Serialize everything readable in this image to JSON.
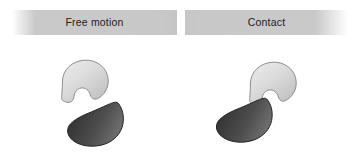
{
  "figure": {
    "width": 359,
    "height": 160,
    "background": "#ffffff"
  },
  "panels": [
    {
      "id": "free-motion",
      "label": "Free motion",
      "bar_color": "#c8c8c8",
      "label_color": "#1c1c1c",
      "state": "separated",
      "shapes": [
        {
          "name": "light-bean-shape",
          "role": "upper-body",
          "fill_light": "#e8e8e8",
          "fill_dark": "#c2c2c2",
          "outline": "#8d8d8d"
        },
        {
          "name": "dark-blob-shape",
          "role": "lower-body",
          "fill_light": "#747474",
          "fill_dark": "#343434",
          "outline": "#222222"
        }
      ]
    },
    {
      "id": "contact",
      "label": "Contact",
      "bar_color": "#c8c8c8",
      "label_color": "#1c1c1c",
      "state": "touching",
      "shapes": [
        {
          "name": "light-bean-shape",
          "role": "upper-body",
          "fill_light": "#e8e8e8",
          "fill_dark": "#c2c2c2",
          "outline": "#8d8d8d"
        },
        {
          "name": "dark-blob-shape",
          "role": "lower-body",
          "fill_light": "#747474",
          "fill_dark": "#343434",
          "outline": "#222222"
        }
      ]
    }
  ]
}
